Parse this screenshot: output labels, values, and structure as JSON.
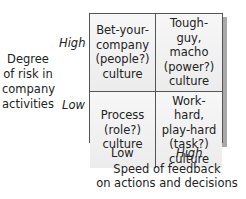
{
  "diagram": {
    "type": "2x2-matrix",
    "y_axis": {
      "title": "Degree\nof risk in\ncompany\nactivities",
      "high_label": "High",
      "low_label": "Low"
    },
    "x_axis": {
      "title": "Speed of feedback\non actions and decisions",
      "low_label": "Low",
      "high_label": "High"
    },
    "cells": {
      "top_left": "Bet-your-\ncompany\n(people?)\nculture",
      "top_right": "Tough-guy,\nmacho\n(power?)\nculture",
      "bottom_left": "Process\n(role?)\nculture",
      "bottom_right": "Work-hard,\nplay-hard\n(task?)\nculture"
    },
    "colors": {
      "border": "#555555",
      "cell_fill": "#efefef",
      "shadow": "#a9a9a9"
    }
  }
}
